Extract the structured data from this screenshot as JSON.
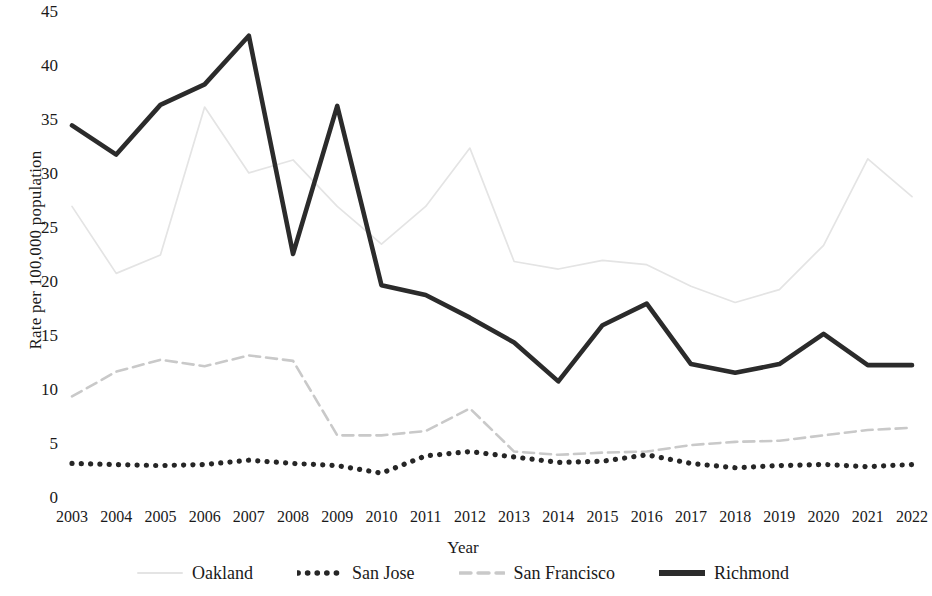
{
  "chart_data": {
    "type": "line",
    "title": "",
    "xlabel": "Year",
    "ylabel": "Rate per 100,000 population",
    "categories": [
      "2003",
      "2004",
      "2005",
      "2006",
      "2007",
      "2008",
      "2009",
      "2010",
      "2011",
      "2012",
      "2013",
      "2014",
      "2015",
      "2016",
      "2017",
      "2018",
      "2019",
      "2020",
      "2021",
      "2022"
    ],
    "x": [
      2003,
      2004,
      2005,
      2006,
      2007,
      2008,
      2009,
      2010,
      2011,
      2012,
      2013,
      2014,
      2015,
      2016,
      2017,
      2018,
      2019,
      2020,
      2021,
      2022
    ],
    "ylim": [
      0,
      45
    ],
    "yticks": [
      0,
      5,
      10,
      15,
      20,
      25,
      30,
      35,
      40,
      45
    ],
    "grid": false,
    "legend_position": "bottom",
    "series": [
      {
        "name": "Oakland",
        "style": "solid-light",
        "color": "#e4e4e4",
        "values": [
          27.0,
          20.8,
          22.5,
          36.2,
          30.1,
          31.3,
          27.0,
          23.5,
          27.0,
          32.4,
          21.9,
          21.2,
          22.0,
          21.6,
          19.6,
          18.1,
          19.3,
          23.4,
          31.4,
          27.9
        ]
      },
      {
        "name": "San Jose",
        "style": "dotted",
        "color": "#262626",
        "values": [
          3.2,
          3.1,
          3.0,
          3.1,
          3.5,
          3.2,
          3.0,
          2.3,
          3.9,
          4.3,
          3.8,
          3.3,
          3.4,
          4.0,
          3.2,
          2.8,
          3.0,
          3.1,
          2.9,
          3.1
        ]
      },
      {
        "name": "San Francisco",
        "style": "dashed-light",
        "color": "#c9c9c9",
        "values": [
          9.4,
          11.7,
          12.8,
          12.2,
          13.2,
          12.7,
          5.8,
          5.8,
          6.2,
          8.3,
          4.3,
          4.0,
          4.2,
          4.3,
          4.9,
          5.2,
          5.3,
          5.8,
          6.3,
          6.5
        ]
      },
      {
        "name": "Richmond",
        "style": "solid-thick",
        "color": "#2b2b2b",
        "values": [
          34.5,
          31.8,
          36.4,
          38.3,
          42.8,
          22.6,
          36.3,
          19.7,
          18.8,
          16.7,
          14.4,
          10.8,
          16.0,
          18.0,
          12.4,
          11.6,
          12.4,
          15.2,
          12.3,
          12.3
        ]
      }
    ]
  },
  "legend": {
    "items": [
      {
        "label": "Oakland"
      },
      {
        "label": "San Jose"
      },
      {
        "label": "San Francisco"
      },
      {
        "label": "Richmond"
      }
    ]
  }
}
